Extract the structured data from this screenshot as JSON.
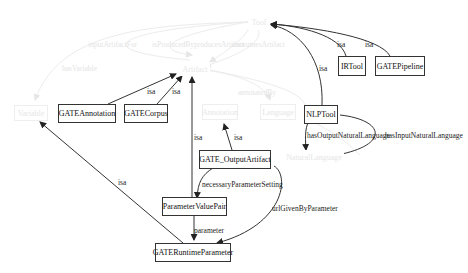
{
  "diagram": {
    "type": "ontology-graph",
    "nodes": [
      {
        "id": "tool",
        "label": "Tool",
        "faded": true
      },
      {
        "id": "artifact",
        "label": "Artifact",
        "faded": true
      },
      {
        "id": "variable",
        "label": "Variable",
        "faded": true
      },
      {
        "id": "annotation_faded",
        "label": "Annotation",
        "faded": true
      },
      {
        "id": "language",
        "label": "Language",
        "faded": true
      },
      {
        "id": "natural_language",
        "label": "NaturalLanguage",
        "faded": true
      },
      {
        "id": "gate_annotation",
        "label": "GATEAnnotation",
        "faded": false
      },
      {
        "id": "gate_corpus",
        "label": "GATECorpus",
        "faded": false
      },
      {
        "id": "ir_tool",
        "label": "IRTool",
        "faded": false
      },
      {
        "id": "gate_pipeline",
        "label": "GATEPipeline",
        "faded": false
      },
      {
        "id": "nlp_tool",
        "label": "NLPTool",
        "faded": false
      },
      {
        "id": "gate_output_artifact",
        "label": "GATE_OutputArtifact",
        "faded": false
      },
      {
        "id": "parameter_value_pair",
        "label": "ParameterValuePair",
        "faded": false
      },
      {
        "id": "gate_runtime_parameter",
        "label": "GATERuntimeParameter",
        "faded": false
      }
    ],
    "edges": [
      {
        "from": "gate_annotation",
        "to": "artifact",
        "label": "isa"
      },
      {
        "from": "gate_corpus",
        "to": "artifact",
        "label": "isa"
      },
      {
        "from": "ir_tool",
        "to": "tool",
        "label": "isa"
      },
      {
        "from": "gate_pipeline",
        "to": "tool",
        "label": "isa"
      },
      {
        "from": "nlp_tool",
        "to": "tool",
        "label": "isa"
      },
      {
        "from": "parameter_value_pair",
        "to": "artifact",
        "label": "isa"
      },
      {
        "from": "gate_output_artifact",
        "to": "annotation_faded",
        "label": "isa"
      },
      {
        "from": "gate_runtime_parameter",
        "to": "variable",
        "label": "isa"
      },
      {
        "from": "gate_output_artifact",
        "to": "parameter_value_pair",
        "label": "necessaryParameterSetting"
      },
      {
        "from": "gate_output_artifact",
        "to": "gate_runtime_parameter",
        "label": "urlGivenByParameter"
      },
      {
        "from": "parameter_value_pair",
        "to": "gate_runtime_parameter",
        "label": "parameter"
      },
      {
        "from": "nlp_tool",
        "to": "natural_language",
        "label": "hasOutputNaturalLanguage"
      },
      {
        "from": "nlp_tool",
        "to": "natural_language",
        "label": "hasInputNaturalLanguage"
      }
    ],
    "faded_edge_labels": [
      "inputArtifactFor",
      "isProducedBy",
      "producesArtifact",
      "consumesArtifact",
      "hasVariable",
      "annotatedBy",
      "isa"
    ],
    "labels": {
      "isa": "isa",
      "necessary": "necessaryParameterSetting",
      "url": "urlGivenByParameter",
      "parameter": "parameter",
      "hasOutput": "hasOutputNaturalLanguage",
      "hasInput": "hasInputNaturalLanguage"
    }
  }
}
